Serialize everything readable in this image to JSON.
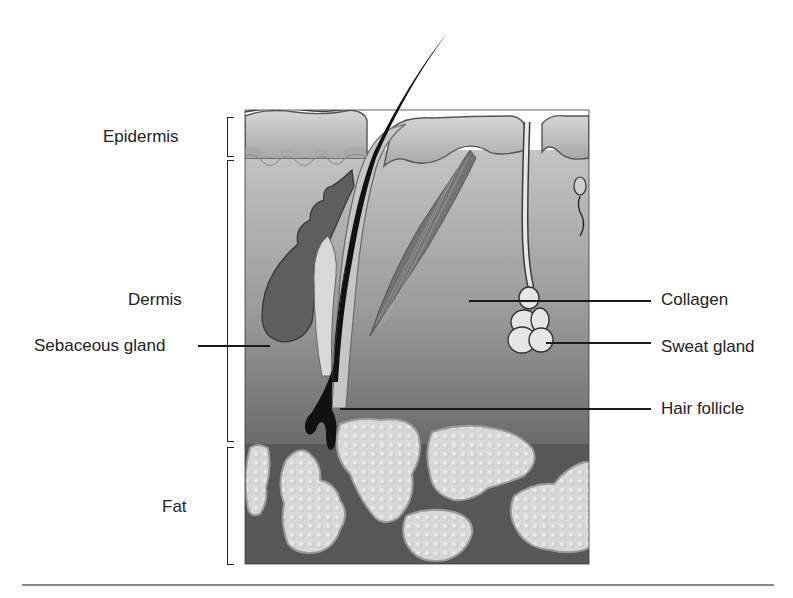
{
  "figure": {
    "layers": [
      {
        "id": "epidermis",
        "label": "Epidermis"
      },
      {
        "id": "dermis",
        "label": "Dermis"
      },
      {
        "id": "fat",
        "label": "Fat"
      }
    ],
    "callouts_left": [
      {
        "id": "sebaceous-gland",
        "label": "Sebaceous gland"
      }
    ],
    "callouts_right": [
      {
        "id": "collagen",
        "label": "Collagen"
      },
      {
        "id": "sweat-gland",
        "label": "Sweat gland"
      },
      {
        "id": "hair-follicle",
        "label": "Hair follicle"
      }
    ],
    "colors": {
      "epidermis": "#c9c9c9",
      "epidermis_dark": "#9c9c9c",
      "dermis_top": "#bdbdbd",
      "dermis_bottom": "#6e6e6e",
      "fat_bg": "#595959",
      "fat_cells": "#e2e2e2",
      "hair": "#111111",
      "sebaceous": "#5a5a5a",
      "sweat_gland": "#e6e6e6"
    }
  }
}
